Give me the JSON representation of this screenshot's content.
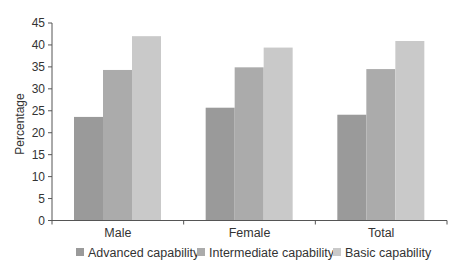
{
  "chart_data": {
    "type": "bar",
    "title": "",
    "xlabel": "",
    "ylabel": "Percentage",
    "ylim": [
      0,
      45
    ],
    "yticks": [
      0,
      5,
      10,
      15,
      20,
      25,
      30,
      35,
      40,
      45
    ],
    "grid": false,
    "legend_position": "bottom",
    "categories": [
      "Male",
      "Female",
      "Total"
    ],
    "series": [
      {
        "name": "Advanced capability",
        "color": "#9a9a9a",
        "values": [
          23.6,
          25.7,
          24.1
        ]
      },
      {
        "name": "Intermediate capability",
        "color": "#ababab",
        "values": [
          34.3,
          34.9,
          34.5
        ]
      },
      {
        "name": "Basic capability",
        "color": "#c9c9c9",
        "values": [
          42.0,
          39.4,
          40.9
        ]
      }
    ]
  }
}
